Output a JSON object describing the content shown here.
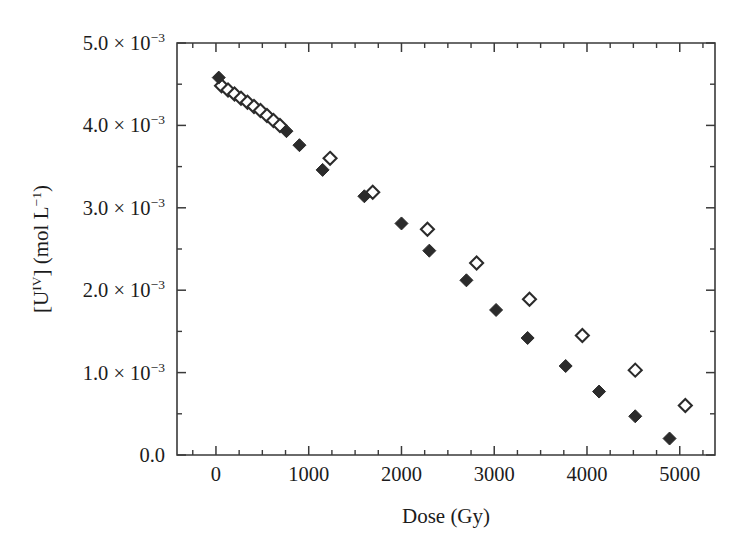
{
  "chart_data": {
    "type": "scatter",
    "title": "",
    "xlabel": "Dose (Gy)",
    "ylabel": "[U^IV] (mol L^-1)",
    "ylabel_parts": {
      "bracket_open": "[U",
      "element_sup": "IV",
      "bracket_close": "] (mol L",
      "unit_sup": "−1",
      "tail": ")"
    },
    "xlim": [
      -420,
      5380
    ],
    "ylim": [
      0,
      0.005
    ],
    "grid": false,
    "legend": "none",
    "x_ticks": [
      0,
      1000,
      2000,
      3000,
      4000,
      5000
    ],
    "x_tick_labels": [
      "0",
      "1000",
      "2000",
      "3000",
      "4000",
      "5000"
    ],
    "x_minor_tick_interval": 250,
    "y_ticks": [
      0,
      0.001,
      0.002,
      0.003,
      0.004,
      0.005
    ],
    "y_tick_labels": [
      "0.0",
      "1.0 × 10−3",
      "2.0 × 10−3",
      "3.0 × 10−3",
      "4.0 × 10−3",
      "5.0 × 10−3"
    ],
    "y_tick_label_parts": [
      {
        "mantissa": "0.0",
        "times": "",
        "base": "",
        "exp": ""
      },
      {
        "mantissa": "1.0",
        "times": " × ",
        "base": "10",
        "exp": "−3"
      },
      {
        "mantissa": "2.0",
        "times": " × ",
        "base": "10",
        "exp": "−3"
      },
      {
        "mantissa": "3.0",
        "times": " × ",
        "base": "10",
        "exp": "−3"
      },
      {
        "mantissa": "4.0",
        "times": " × ",
        "base": "10",
        "exp": "−3"
      },
      {
        "mantissa": "5.0",
        "times": " × ",
        "base": "10",
        "exp": "−3"
      }
    ],
    "y_minor_tick_interval": 0.0005,
    "marker_color": "#2b2b2b",
    "axis_color": "#3a3a3a",
    "series": [
      {
        "name": "filled-diamond-series",
        "marker": "filled-diamond",
        "x": [
          30,
          760,
          900,
          1150,
          1600,
          2000,
          2300,
          2700,
          3020,
          3360,
          3770,
          4130,
          4520,
          4890
        ],
        "y": [
          0.00458,
          0.00393,
          0.00376,
          0.00346,
          0.00314,
          0.00281,
          0.00248,
          0.00212,
          0.00176,
          0.00142,
          0.00108,
          0.00077,
          0.00047,
          0.0002
        ]
      },
      {
        "name": "open-diamond-series",
        "marker": "open-diamond",
        "x": [
          60,
          130,
          200,
          270,
          340,
          410,
          480,
          550,
          620,
          690,
          1230,
          1690,
          2280,
          2810,
          3380,
          3950,
          4520,
          5060
        ],
        "y": [
          0.00448,
          0.00443,
          0.00438,
          0.00433,
          0.00428,
          0.00423,
          0.00418,
          0.00412,
          0.00406,
          0.004,
          0.0036,
          0.00319,
          0.00274,
          0.00233,
          0.00189,
          0.00145,
          0.00103,
          0.0006
        ]
      }
    ]
  },
  "layout": {
    "plot_left": 177,
    "plot_right": 715,
    "plot_top": 43,
    "plot_bottom": 455,
    "marker_size": 13
  }
}
